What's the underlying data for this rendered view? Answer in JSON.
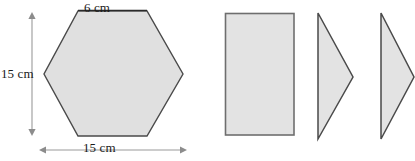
{
  "figure": {
    "units": "cm",
    "colors": {
      "shape_fill": "#e0e0e0",
      "shape_stroke": "#4a4a4a",
      "dimension_line": "#8c8c8c",
      "label_text": "#1a1a1a",
      "background": "#ffffff"
    },
    "labels": {
      "top": "6 cm",
      "left": "15 cm",
      "bottom": "15 cm"
    },
    "shapes": [
      {
        "name": "hexagon",
        "type": "polygon",
        "points": "78,11 147,11 183,74 147,136 78,136 44,74",
        "description": "Irregular hexagon, 6 cm top edge, 15 cm width, 15 cm height"
      },
      {
        "name": "rectangle",
        "type": "rect",
        "x": 225,
        "y": 13,
        "width": 69,
        "height": 122,
        "description": "Rectangle piece of the hexagon decomposition"
      },
      {
        "name": "triangle-1",
        "type": "polygon",
        "points": "318,13 353,77 318,139",
        "description": "Right-pointing triangle piece"
      },
      {
        "name": "triangle-2",
        "type": "polygon",
        "points": "381,13 414,77 381,139",
        "description": "Second right-pointing triangle piece"
      }
    ],
    "dimension_lines": [
      {
        "name": "vertical-height-line",
        "orientation": "vertical",
        "x": 32,
        "y1": 14,
        "y2": 134,
        "arrows": "both",
        "measures": "15 cm"
      },
      {
        "name": "horizontal-width-line",
        "orientation": "horizontal",
        "y": 150,
        "x1": 40,
        "x2": 186,
        "arrows": "both",
        "measures": "15 cm"
      },
      {
        "name": "top-edge-rule",
        "orientation": "horizontal",
        "y": 11,
        "x1": 78,
        "x2": 147,
        "arrows": "none",
        "measures": "6 cm"
      }
    ]
  }
}
